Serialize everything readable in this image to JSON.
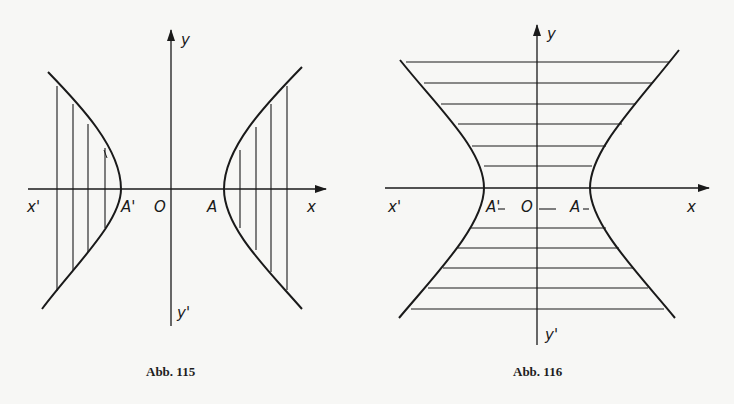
{
  "figures": [
    {
      "id": "fig115",
      "caption": "Abb. 115",
      "hatching": "vertical",
      "labels": {
        "y": "y",
        "y_neg": "y'",
        "x": "x",
        "x_neg": "x'",
        "origin": "O",
        "vertex_right": "A",
        "vertex_left": "A'"
      }
    },
    {
      "id": "fig116",
      "caption": "Abb. 116",
      "hatching": "horizontal",
      "labels": {
        "y": "y",
        "y_neg": "y'",
        "x": "x",
        "x_neg": "x'",
        "origin": "O",
        "vertex_right": "A",
        "vertex_left": "A'"
      }
    }
  ],
  "colors": {
    "ink": "#1a1a1a",
    "paper": "#f7f7f5"
  }
}
